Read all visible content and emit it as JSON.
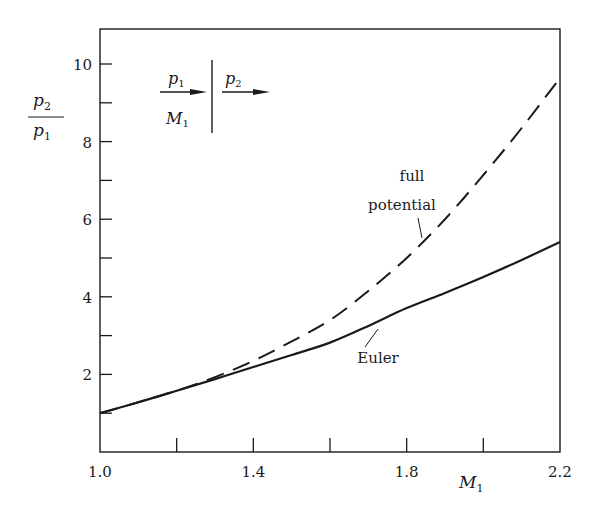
{
  "chart_data": {
    "type": "line",
    "title": "",
    "xlabel": "M1",
    "ylabel": "p2/p1",
    "xlim": [
      1.0,
      2.2
    ],
    "ylim": [
      0,
      11
    ],
    "x_ticks": [
      1.0,
      1.2,
      1.4,
      1.6,
      1.8,
      2.0,
      2.2
    ],
    "x_tick_labels": [
      "1.0",
      "",
      "1.4",
      "",
      "1.8",
      "",
      "2.2"
    ],
    "y_ticks": [
      1,
      2,
      3,
      4,
      5,
      6,
      7,
      8,
      9,
      10
    ],
    "y_tick_labels": [
      "",
      "2",
      "",
      "4",
      "",
      "6",
      "",
      "8",
      "",
      "10"
    ],
    "grid": false,
    "series": [
      {
        "name": "Euler",
        "style": "solid",
        "x": [
          1.0,
          1.1,
          1.2,
          1.3,
          1.4,
          1.5,
          1.6,
          1.7,
          1.8,
          1.9,
          2.0,
          2.1,
          2.2
        ],
        "values": [
          1.0,
          1.28,
          1.58,
          1.88,
          2.19,
          2.5,
          2.82,
          3.25,
          3.71,
          4.1,
          4.51,
          4.95,
          5.41
        ]
      },
      {
        "name": "full potential",
        "style": "dashed",
        "x": [
          1.0,
          1.1,
          1.2,
          1.3,
          1.4,
          1.5,
          1.6,
          1.7,
          1.8,
          1.9,
          2.0,
          2.1,
          2.2
        ],
        "values": [
          1.0,
          1.28,
          1.58,
          1.93,
          2.35,
          2.85,
          3.4,
          4.15,
          5.0,
          6.0,
          7.14,
          8.35,
          9.64
        ]
      }
    ],
    "annotations": [
      {
        "text": "full",
        "target": "full potential"
      },
      {
        "text": "potential",
        "target": "full potential"
      },
      {
        "text": "Euler",
        "target": "Euler"
      }
    ],
    "inset": {
      "upstream_pressure": "p",
      "upstream_pressure_sub": "1",
      "downstream_pressure": "p",
      "downstream_pressure_sub": "2",
      "upstream_mach": "M",
      "upstream_mach_sub": "1"
    }
  },
  "axis": {
    "y_num": "p",
    "y_num_sub": "2",
    "y_den": "p",
    "y_den_sub": "1",
    "x_label": "M",
    "x_label_sub": "1"
  }
}
